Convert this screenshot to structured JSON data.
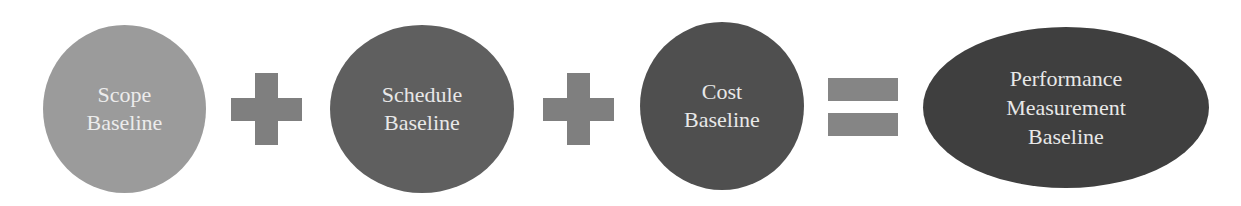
{
  "diagram": {
    "type": "equation",
    "operands": [
      {
        "id": "scope",
        "lines": [
          "Scope",
          "Baseline"
        ],
        "shape": "circle",
        "fill": "#9b9b9b"
      },
      {
        "id": "schedule",
        "lines": [
          "Schedule",
          "Baseline"
        ],
        "shape": "ellipse",
        "fill": "#5f5f5f"
      },
      {
        "id": "cost",
        "lines": [
          "Cost",
          "Baseline"
        ],
        "shape": "circle",
        "fill": "#4f4f4f"
      }
    ],
    "operators": [
      {
        "id": "plus1",
        "symbol": "plus-icon",
        "color": "#7f7f7f"
      },
      {
        "id": "plus2",
        "symbol": "plus-icon",
        "color": "#7f7f7f"
      },
      {
        "id": "equals",
        "symbol": "equals-icon",
        "color": "#858585"
      }
    ],
    "result": {
      "id": "pmb",
      "lines": [
        "Performance",
        "Measurement",
        "Baseline"
      ],
      "shape": "ellipse",
      "fill": "#3f3f3f"
    },
    "text_color": "#e8e8e8"
  }
}
